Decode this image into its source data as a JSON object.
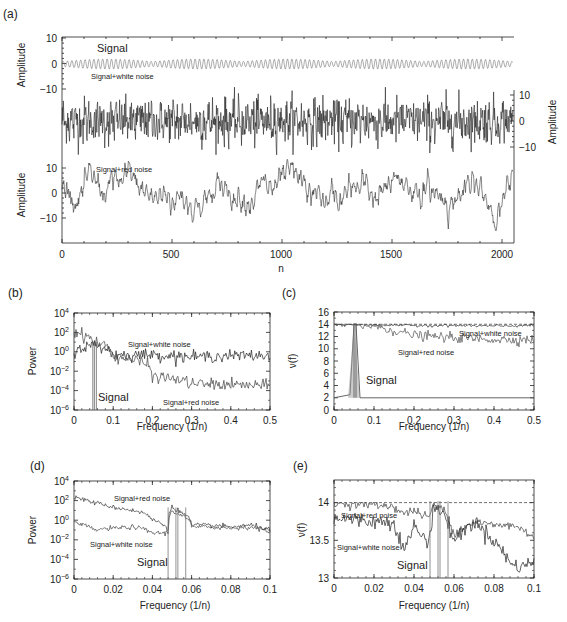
{
  "chart_data": [
    {
      "panel": "(a)",
      "type": "line",
      "xlabel": "n",
      "x_ticks": [
        0,
        500,
        1000,
        1500,
        2000
      ],
      "xlim": [
        0,
        2048
      ],
      "series": [
        {
          "name": "Signal",
          "ylabel": "Amplitude",
          "axis": "left-upper",
          "y_ticks": [
            10,
            0,
            -10
          ],
          "description": "amplitude-modulated sinusoid at f≈0.05, amplitude ≈ ±2"
        },
        {
          "name": "Signal+white noise",
          "ylabel": "Amplitude",
          "axis": "right",
          "y_ticks": [
            10,
            0,
            -10
          ],
          "description": "signal plus white noise, range ≈ -12 to 12"
        },
        {
          "name": "Signal+red noise",
          "ylabel": "Amplitude",
          "axis": "left-lower",
          "y_ticks": [
            10,
            0,
            -10
          ],
          "description": "signal plus red noise, range ≈ -15 to 15"
        }
      ]
    },
    {
      "panel": "(b)",
      "type": "line",
      "xlabel": "Frequency (1/n)",
      "ylabel": "Power",
      "yscale": "log",
      "x_ticks": [
        "0",
        "0.1",
        "0.2",
        "0.3",
        "0.4",
        "0.5"
      ],
      "y_ticks": [
        "10^4",
        "10^2",
        "10^0",
        "10^-2",
        "10^-4",
        "10^-6"
      ],
      "xlim": [
        0,
        0.5
      ],
      "ylim": [
        1e-06,
        10000.0
      ],
      "series": [
        {
          "name": "Signal+white noise",
          "x": [
            0,
            0.05,
            0.1,
            0.2,
            0.3,
            0.4,
            0.5
          ],
          "values": [
            1,
            5,
            0.5,
            0.5,
            0.3,
            0.4,
            0.4
          ]
        },
        {
          "name": "Signal+red noise",
          "x": [
            0,
            0.05,
            0.1,
            0.2,
            0.3,
            0.4,
            0.5
          ],
          "values": [
            100,
            10,
            0.3,
            0.003,
            0.0005,
            0.0004,
            0.0003
          ]
        },
        {
          "name": "Signal",
          "x": [
            0.048,
            0.052,
            0.057
          ],
          "values": [
            10,
            10,
            10
          ],
          "description": "narrow spectral peaks near f≈0.05"
        }
      ]
    },
    {
      "panel": "(c)",
      "type": "line",
      "xlabel": "Frequency (1/n)",
      "ylabel": "ν(f)",
      "x_ticks": [
        "0",
        "0.1",
        "0.2",
        "0.3",
        "0.4",
        "0.5"
      ],
      "y_ticks": [
        "0",
        "2",
        "4",
        "6",
        "8",
        "10",
        "12",
        "14",
        "16"
      ],
      "xlim": [
        0,
        0.5
      ],
      "ylim": [
        0,
        16
      ],
      "reference_line": 14,
      "series": [
        {
          "name": "Signal+white noise",
          "x": [
            0,
            0.1,
            0.2,
            0.3,
            0.4,
            0.5
          ],
          "values": [
            14,
            13.9,
            13.8,
            13.8,
            13.7,
            13.8
          ]
        },
        {
          "name": "Signal+red noise",
          "x": [
            0,
            0.1,
            0.2,
            0.3,
            0.4,
            0.5
          ],
          "values": [
            14,
            13.7,
            12.2,
            11.8,
            11.5,
            11.5
          ]
        },
        {
          "name": "Signal",
          "x": [
            0,
            0.04,
            0.05,
            0.055,
            0.065,
            0.1,
            0.5
          ],
          "values": [
            2,
            2.5,
            14,
            14,
            2,
            2,
            2
          ]
        }
      ]
    },
    {
      "panel": "(d)",
      "type": "line",
      "xlabel": "Frequency (1/n)",
      "ylabel": "Power",
      "yscale": "log",
      "x_ticks": [
        "0",
        "0.02",
        "0.04",
        "0.06",
        "0.08",
        "0.1"
      ],
      "y_ticks": [
        "10^4",
        "10^2",
        "10^0",
        "10^-2",
        "10^-4",
        "10^-6"
      ],
      "xlim": [
        0,
        0.1
      ],
      "ylim": [
        1e-06,
        10000.0
      ],
      "series": [
        {
          "name": "Signal+red noise",
          "x": [
            0,
            0.01,
            0.02,
            0.03,
            0.04,
            0.048,
            0.05,
            0.055,
            0.06,
            0.07,
            0.08,
            0.09,
            0.1
          ],
          "values": [
            200,
            60,
            20,
            10,
            1,
            0.1,
            20,
            5,
            0.3,
            0.3,
            0.2,
            0.3,
            0.1
          ]
        },
        {
          "name": "Signal+white noise",
          "x": [
            0,
            0.01,
            0.02,
            0.03,
            0.04,
            0.048,
            0.05,
            0.055,
            0.06,
            0.07,
            0.08,
            0.09,
            0.1
          ],
          "values": [
            0.5,
            0.1,
            0.15,
            0.2,
            0.05,
            0.05,
            8,
            3,
            0.2,
            0.2,
            0.15,
            0.2,
            0.05
          ]
        },
        {
          "name": "Signal",
          "x": [
            0.048,
            0.052,
            0.053,
            0.057
          ],
          "description": "vertical lines at signal frequencies"
        }
      ]
    },
    {
      "panel": "(e)",
      "type": "line",
      "xlabel": "Frequency (1/n)",
      "ylabel": "ν(f)",
      "x_ticks": [
        "0",
        "0.02",
        "0.04",
        "0.06",
        "0.08",
        "0.1"
      ],
      "y_ticks": [
        "13",
        "13.5",
        "14"
      ],
      "xlim": [
        0,
        0.1
      ],
      "ylim": [
        13,
        14.3
      ],
      "reference_line": 14,
      "series": [
        {
          "name": "Signal+red noise",
          "x": [
            0,
            0.02,
            0.03,
            0.035,
            0.04,
            0.047,
            0.05,
            0.055,
            0.06,
            0.07,
            0.08,
            0.09,
            0.1
          ],
          "values": [
            14,
            13.97,
            13.95,
            13.85,
            13.9,
            13.8,
            13.97,
            13.9,
            13.6,
            13.75,
            13.7,
            13.7,
            13.55
          ]
        },
        {
          "name": "Signal+white noise",
          "x": [
            0,
            0.02,
            0.03,
            0.035,
            0.04,
            0.047,
            0.05,
            0.055,
            0.06,
            0.07,
            0.08,
            0.09,
            0.1
          ],
          "values": [
            13.8,
            13.75,
            13.75,
            13.35,
            13.7,
            13.45,
            13.95,
            13.85,
            13.5,
            13.75,
            13.5,
            13.15,
            13.2
          ]
        },
        {
          "name": "Signal",
          "x": [
            0.048,
            0.052,
            0.053,
            0.057
          ],
          "description": "vertical lines at signal frequencies"
        }
      ]
    }
  ],
  "labels": {
    "a": {
      "panel": "(a)",
      "ylabel": "Amplitude",
      "xlabel": "n",
      "signal": "Signal",
      "white": "Signal+white noise",
      "red": "Signal+red noise",
      "xt": [
        "0",
        "500",
        "1000",
        "1500",
        "2000"
      ],
      "yt": [
        "10",
        "0",
        "−10"
      ]
    },
    "b": {
      "panel": "(b)",
      "ylabel": "Power",
      "xlabel": "Frequency (1/n)",
      "white": "Signal+white noise",
      "red": "Signal+red noise",
      "signal": "Signal",
      "xt": [
        "0",
        "0.1",
        "0.2",
        "0.3",
        "0.4",
        "0.5"
      ],
      "yexp": [
        "4",
        "2",
        "0",
        "−2",
        "−4",
        "−6"
      ]
    },
    "c": {
      "panel": "(c)",
      "ylabel": "ν(f)",
      "xlabel": "Frequency (1/n)",
      "white": "Signal+white noise",
      "red": "Signal+red noise",
      "signal": "Signal",
      "xt": [
        "0",
        "0.1",
        "0.2",
        "0.3",
        "0.4",
        "0.5"
      ],
      "yt": [
        "0",
        "2",
        "4",
        "6",
        "8",
        "10",
        "12",
        "14",
        "16"
      ]
    },
    "d": {
      "panel": "(d)",
      "ylabel": "Power",
      "xlabel": "Frequency (1/n)",
      "white": "Signal+white noise",
      "red": "Signal+red noise",
      "signal": "Signal",
      "xt": [
        "0",
        "0.02",
        "0.04",
        "0.06",
        "0.08",
        "0.1"
      ],
      "yexp": [
        "4",
        "2",
        "0",
        "−2",
        "−4",
        "−6"
      ]
    },
    "e": {
      "panel": "(e)",
      "ylabel": "ν(f)",
      "xlabel": "Frequency (1/n)",
      "white": "Signal+white noise",
      "red": "Signal+red noise",
      "signal": "Signal",
      "xt": [
        "0",
        "0.02",
        "0.04",
        "0.06",
        "0.08",
        "0.1"
      ],
      "yt": [
        "13",
        "13.5",
        "14"
      ]
    }
  }
}
